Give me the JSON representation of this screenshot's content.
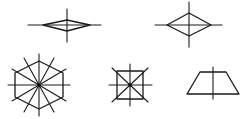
{
  "diagram": {
    "title": "",
    "stroke_color": "#1a1a1a",
    "background": "#ffffff",
    "shapes": [
      {
        "name": "flat-rhombus",
        "polygon": [
          [
            43,
            25
          ],
          [
            67,
            20
          ],
          [
            90,
            25
          ],
          [
            67,
            31
          ]
        ],
        "axes": [
          [
            [
              28,
              25
            ],
            [
              101,
              25
            ]
          ],
          [
            [
              67,
              9
            ],
            [
              67,
              42
            ]
          ]
        ],
        "symmetry_lines": 2
      },
      {
        "name": "rhombus",
        "polygon": [
          [
            167,
            25
          ],
          [
            189,
            13
          ],
          [
            211,
            25
          ],
          [
            189,
            36
          ]
        ],
        "axes": [
          [
            [
              155,
              25
            ],
            [
              222,
              25
            ]
          ],
          [
            [
              189,
              2
            ],
            [
              189,
              47
            ]
          ]
        ],
        "symmetry_lines": 2
      },
      {
        "name": "regular-hexagon",
        "center": [
          39,
          85
        ],
        "polygon": [
          [
            39,
            61
          ],
          [
            63,
            73
          ],
          [
            63,
            97
          ],
          [
            39,
            109
          ],
          [
            15,
            97
          ],
          [
            15,
            73
          ]
        ],
        "axes": [
          [
            [
              8,
              85
            ],
            [
              70,
              85
            ]
          ],
          [
            [
              39,
              54
            ],
            [
              39,
              116
            ]
          ],
          [
            [
              12,
              69
            ],
            [
              66,
              101
            ]
          ],
          [
            [
              12,
              101
            ],
            [
              66,
              69
            ]
          ],
          [
            [
              24,
              58
            ],
            [
              54,
              112
            ]
          ],
          [
            [
              24,
              112
            ],
            [
              54,
              58
            ]
          ]
        ],
        "symmetry_lines": 6
      },
      {
        "name": "square",
        "center": [
          130,
          85
        ],
        "polygon": [
          [
            117,
            71
          ],
          [
            143,
            71
          ],
          [
            143,
            99
          ],
          [
            117,
            99
          ]
        ],
        "axes": [
          [
            [
              109,
              85
            ],
            [
              152,
              85
            ]
          ],
          [
            [
              130,
              64
            ],
            [
              130,
              106
            ]
          ],
          [
            [
              112,
              68
            ],
            [
              148,
              102
            ]
          ],
          [
            [
              112,
              102
            ],
            [
              148,
              68
            ]
          ]
        ],
        "symmetry_lines": 4
      },
      {
        "name": "isosceles-trapezoid",
        "polygon": [
          [
            200,
            72
          ],
          [
            226,
            72
          ],
          [
            239,
            94
          ],
          [
            187,
            94
          ]
        ],
        "axes": [
          [
            [
              213,
              67
            ],
            [
              213,
              99
            ]
          ]
        ],
        "symmetry_lines": 1
      }
    ]
  }
}
